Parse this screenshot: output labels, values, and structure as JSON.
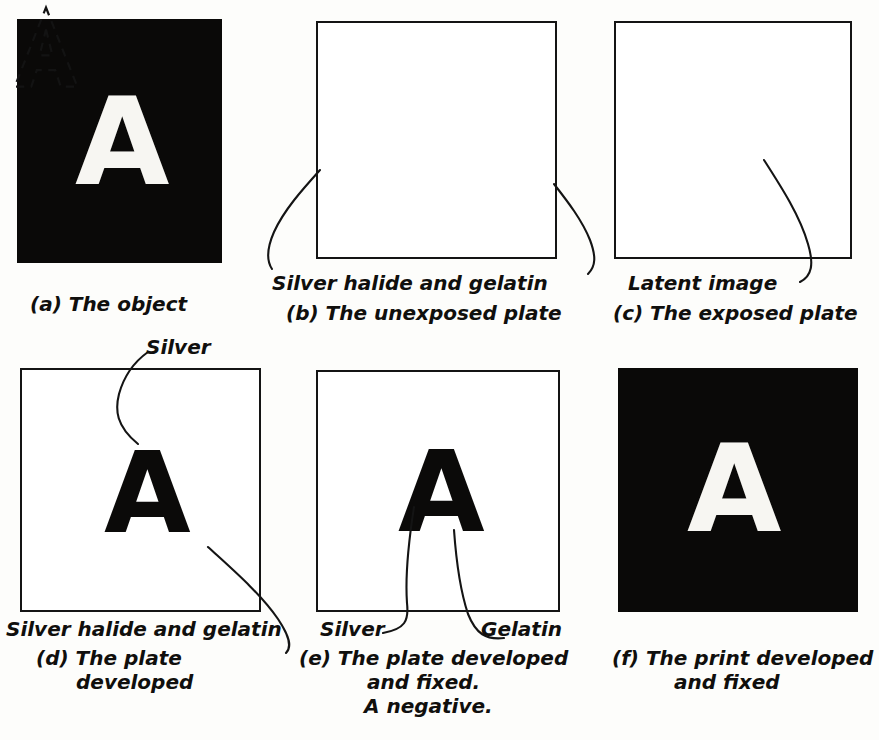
{
  "figure": {
    "ink_color": "#141414",
    "paper_color": "#fdfdfb",
    "dark_plate_color": "#0a0908",
    "light_plate_color": "#ffffff",
    "letter": "A"
  },
  "panels": [
    {
      "id": "a",
      "caption": "(a) The object",
      "caption_lines": [
        "(a) The object"
      ],
      "plate_style": "dark",
      "letter": "A",
      "letter_color": "white",
      "annotations": []
    },
    {
      "id": "b",
      "caption": "(b) The unexposed plate",
      "caption_lines": [
        "(b) The unexposed plate"
      ],
      "plate_style": "light",
      "letter": "",
      "letter_color": "",
      "annotations": [
        "Silver halide and gelatin"
      ]
    },
    {
      "id": "c",
      "caption": "(c) The exposed plate",
      "caption_lines": [
        "(c) The exposed plate"
      ],
      "plate_style": "light",
      "letter": "A",
      "letter_color": "dashed-outline",
      "annotations": [
        "Latent image"
      ]
    },
    {
      "id": "d",
      "caption": "(d) The plate developed",
      "caption_lines": [
        "(d) The plate",
        "developed"
      ],
      "plate_style": "light",
      "letter": "A",
      "letter_color": "black",
      "annotations": [
        "Silver",
        "Silver halide and gelatin"
      ]
    },
    {
      "id": "e",
      "caption": "(e) The plate developed and fixed. A negative.",
      "caption_lines": [
        "(e) The plate developed",
        "and fixed.",
        "A negative."
      ],
      "plate_style": "light",
      "letter": "A",
      "letter_color": "black",
      "annotations": [
        "Silver",
        "Gelatin"
      ]
    },
    {
      "id": "f",
      "caption": "(f) The print developed and fixed",
      "caption_lines": [
        "(f) The print developed",
        "and fixed"
      ],
      "plate_style": "dark",
      "letter": "A",
      "letter_color": "white",
      "annotations": []
    }
  ],
  "labels": {
    "a_caption": "(a) The object",
    "b_anno": "Silver halide and gelatin",
    "b_caption": "(b) The unexposed plate",
    "c_anno": "Latent image",
    "c_caption": "(c) The exposed plate",
    "d_anno_silver": "Silver",
    "d_anno_halide": "Silver halide and gelatin",
    "d_caption_1": "(d) The plate",
    "d_caption_2": "developed",
    "e_anno_silver": "Silver",
    "e_anno_gelatin": "Gelatin",
    "e_caption_1": "(e) The plate developed",
    "e_caption_2": "and fixed.",
    "e_caption_3": "A negative.",
    "f_caption_1": "(f) The print developed",
    "f_caption_2": "and fixed"
  },
  "letters": {
    "a": "A",
    "c": "A",
    "d": "A",
    "e": "A",
    "f": "A"
  }
}
